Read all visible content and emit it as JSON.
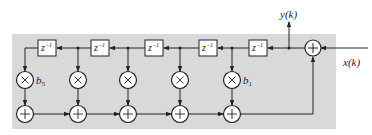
{
  "diagram": {
    "title": "",
    "background_color": "#d9d9d9",
    "line_color": "#222222",
    "input_label": "x(k)",
    "output_label": "y(k)",
    "delay_label": "z",
    "delay_exponent": "−1",
    "coefficient_labels": {
      "first_multiplier": "b",
      "first_multiplier_sub": "5",
      "last_multiplier": "b",
      "last_multiplier_sub": "1"
    },
    "delays": [
      {
        "id": "d1",
        "label": "z^-1"
      },
      {
        "id": "d2",
        "label": "z^-1"
      },
      {
        "id": "d3",
        "label": "z^-1"
      },
      {
        "id": "d4",
        "label": "z^-1"
      },
      {
        "id": "d5",
        "label": "z^-1"
      }
    ],
    "multipliers": [
      {
        "id": "m5",
        "coef": "b5"
      },
      {
        "id": "m4",
        "coef": ""
      },
      {
        "id": "m3",
        "coef": ""
      },
      {
        "id": "m2",
        "coef": ""
      },
      {
        "id": "m1",
        "coef": "b1"
      }
    ],
    "adders_bottom": 5,
    "adder_top": 1
  }
}
